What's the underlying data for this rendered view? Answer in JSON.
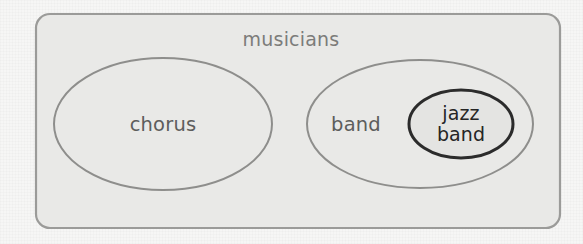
{
  "diagram": {
    "kind": "nested-set-diagram",
    "universe": {
      "name": "musicians-region",
      "label": "musicians",
      "shape": "rounded-rectangle",
      "x": 36,
      "y": 14,
      "width": 524,
      "height": 214,
      "corner_radius": 14,
      "fill": "#e9e9e7",
      "stroke": "#9b9b99",
      "stroke_width": 2.2,
      "label_x": 291,
      "label_y": 39,
      "label_color": "#7c7c7a"
    },
    "sets": [
      {
        "name": "chorus-region",
        "label": "chorus",
        "shape": "ellipse",
        "cx": 163,
        "cy": 124,
        "rx": 109,
        "ry": 66,
        "fill": "#e9e9e7",
        "stroke": "#8e8e8c",
        "stroke_width": 2.0,
        "label_x": 163,
        "label_y": 125,
        "label_color": "#5d5d5c"
      },
      {
        "name": "band-region",
        "label": "band",
        "shape": "ellipse",
        "cx": 420,
        "cy": 124,
        "rx": 113,
        "ry": 64,
        "fill": "#e9e9e7",
        "stroke": "#8e8e8c",
        "stroke_width": 2.0,
        "label_x": 356,
        "label_y": 125,
        "label_color": "#5d5d5c"
      }
    ],
    "subsets": [
      {
        "name": "jazz-band-region",
        "label_line1": "jazz",
        "label_line2": "band",
        "shape": "ellipse",
        "parent": "band-region",
        "cx": 461,
        "cy": 124,
        "rx": 52,
        "ry": 34,
        "fill": "#e4e4e2",
        "stroke": "#2b2b2b",
        "stroke_width": 3.0,
        "label_x": 461,
        "label_y": 124,
        "label_color": "#252525"
      }
    ],
    "canvas": {
      "width": 583,
      "height": 244,
      "background": "#f6f6f5"
    }
  }
}
